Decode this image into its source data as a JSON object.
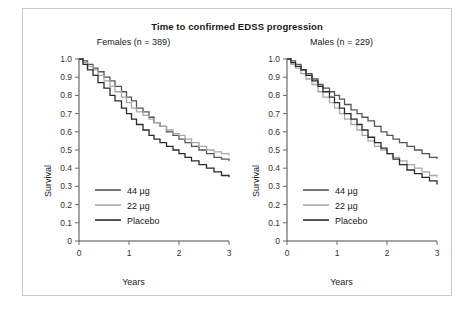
{
  "chart_data": {
    "type": "line",
    "title": "Time to confirmed EDSS progression",
    "xlabel": "Years",
    "ylabel": "Survival",
    "xlim": [
      0,
      3
    ],
    "ylim": [
      0,
      1.0
    ],
    "xticks": [
      "0",
      "1",
      "2",
      "3"
    ],
    "yticks": [
      "0",
      "0.1",
      "0.2",
      "0.3",
      "0.4",
      "0.5",
      "0.6",
      "0.7",
      "0.8",
      "0.9",
      "1.0"
    ],
    "grid": false,
    "legend_position": "lower-left",
    "legend": [
      {
        "label": "44 µg",
        "color": "#555555"
      },
      {
        "label": "22 µg",
        "color": "#a8a8a8"
      },
      {
        "label": "Placebo",
        "color": "#2b2b2b"
      }
    ],
    "panels": [
      {
        "name": "females",
        "subtitle": "Females (n = 389)",
        "series": [
          {
            "name": "44 µg",
            "color": "#555555",
            "x": [
              0,
              0.08,
              0.17,
              0.28,
              0.38,
              0.5,
              0.62,
              0.72,
              0.85,
              0.95,
              1.05,
              1.15,
              1.28,
              1.4,
              1.5,
              1.62,
              1.75,
              1.88,
              2.0,
              2.12,
              2.25,
              2.4,
              2.55,
              2.7,
              2.85,
              3.0
            ],
            "y": [
              1.0,
              0.99,
              0.97,
              0.95,
              0.93,
              0.9,
              0.88,
              0.85,
              0.82,
              0.79,
              0.77,
              0.73,
              0.71,
              0.68,
              0.65,
              0.63,
              0.6,
              0.58,
              0.56,
              0.54,
              0.52,
              0.5,
              0.48,
              0.46,
              0.45,
              0.44
            ]
          },
          {
            "name": "22 µg",
            "color": "#a8a8a8",
            "x": [
              0,
              0.08,
              0.17,
              0.28,
              0.38,
              0.5,
              0.62,
              0.72,
              0.85,
              0.95,
              1.05,
              1.15,
              1.28,
              1.4,
              1.5,
              1.62,
              1.75,
              1.88,
              2.0,
              2.12,
              2.25,
              2.4,
              2.55,
              2.7,
              2.85,
              3.0
            ],
            "y": [
              1.0,
              0.98,
              0.96,
              0.94,
              0.91,
              0.88,
              0.85,
              0.82,
              0.79,
              0.76,
              0.73,
              0.71,
              0.69,
              0.67,
              0.65,
              0.63,
              0.61,
              0.59,
              0.58,
              0.56,
              0.54,
              0.52,
              0.5,
              0.49,
              0.48,
              0.47
            ]
          },
          {
            "name": "Placebo",
            "color": "#2b2b2b",
            "x": [
              0,
              0.08,
              0.17,
              0.28,
              0.38,
              0.5,
              0.62,
              0.72,
              0.85,
              0.95,
              1.05,
              1.15,
              1.28,
              1.4,
              1.5,
              1.62,
              1.75,
              1.88,
              2.0,
              2.12,
              2.25,
              2.4,
              2.55,
              2.7,
              2.85,
              3.0
            ],
            "y": [
              1.0,
              0.97,
              0.94,
              0.91,
              0.87,
              0.84,
              0.8,
              0.77,
              0.73,
              0.7,
              0.67,
              0.64,
              0.61,
              0.58,
              0.56,
              0.54,
              0.52,
              0.5,
              0.48,
              0.46,
              0.44,
              0.42,
              0.4,
              0.38,
              0.36,
              0.35
            ]
          }
        ]
      },
      {
        "name": "males",
        "subtitle": "Males (n = 229)",
        "series": [
          {
            "name": "44 µg",
            "color": "#555555",
            "x": [
              0,
              0.08,
              0.17,
              0.28,
              0.38,
              0.5,
              0.62,
              0.72,
              0.85,
              0.95,
              1.05,
              1.15,
              1.28,
              1.4,
              1.5,
              1.62,
              1.75,
              1.88,
              2.0,
              2.12,
              2.25,
              2.4,
              2.55,
              2.7,
              2.85,
              3.0
            ],
            "y": [
              1.0,
              0.99,
              0.97,
              0.94,
              0.92,
              0.89,
              0.86,
              0.84,
              0.82,
              0.8,
              0.78,
              0.75,
              0.72,
              0.7,
              0.68,
              0.66,
              0.63,
              0.6,
              0.58,
              0.56,
              0.54,
              0.52,
              0.5,
              0.48,
              0.46,
              0.45
            ]
          },
          {
            "name": "22 µg",
            "color": "#a8a8a8",
            "x": [
              0,
              0.08,
              0.17,
              0.28,
              0.38,
              0.5,
              0.62,
              0.72,
              0.85,
              0.95,
              1.05,
              1.15,
              1.28,
              1.4,
              1.5,
              1.62,
              1.75,
              1.88,
              2.0,
              2.12,
              2.25,
              2.4,
              2.55,
              2.7,
              2.85,
              3.0
            ],
            "y": [
              1.0,
              0.97,
              0.95,
              0.92,
              0.89,
              0.86,
              0.82,
              0.79,
              0.76,
              0.73,
              0.7,
              0.67,
              0.64,
              0.61,
              0.58,
              0.55,
              0.52,
              0.5,
              0.48,
              0.46,
              0.44,
              0.42,
              0.4,
              0.38,
              0.36,
              0.35
            ]
          },
          {
            "name": "Placebo",
            "color": "#2b2b2b",
            "x": [
              0,
              0.08,
              0.17,
              0.28,
              0.38,
              0.5,
              0.62,
              0.72,
              0.85,
              0.95,
              1.05,
              1.15,
              1.28,
              1.4,
              1.5,
              1.62,
              1.75,
              1.88,
              2.0,
              2.12,
              2.25,
              2.4,
              2.55,
              2.7,
              2.85,
              3.0
            ],
            "y": [
              1.0,
              0.98,
              0.96,
              0.94,
              0.91,
              0.88,
              0.85,
              0.82,
              0.79,
              0.76,
              0.73,
              0.7,
              0.67,
              0.64,
              0.61,
              0.57,
              0.54,
              0.51,
              0.48,
              0.45,
              0.42,
              0.39,
              0.37,
              0.35,
              0.33,
              0.31
            ]
          }
        ]
      }
    ]
  }
}
